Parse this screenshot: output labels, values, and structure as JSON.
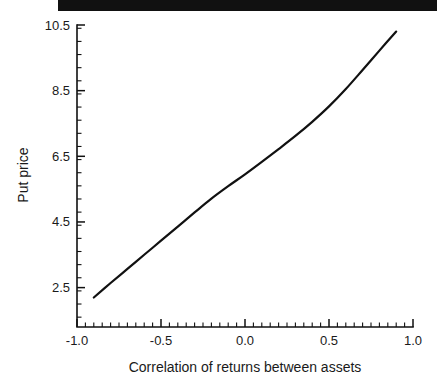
{
  "figure": {
    "header_bar_color": "#111111",
    "background_color": "#ffffff",
    "line_color": "#111111"
  },
  "chart_data": {
    "type": "line",
    "title": "",
    "subtitle": "",
    "xlabel": "Correlation of returns between assets",
    "ylabel": "Put price",
    "xlim": [
      -1.0,
      1.0
    ],
    "ylim": [
      1.3,
      10.5
    ],
    "grid": false,
    "legend": null,
    "xticks": [
      -1.0,
      -0.5,
      0.0,
      0.5,
      1.0
    ],
    "xtick_labels": [
      "-1.0",
      "-0.5",
      "0.0",
      "0.5",
      "1.0"
    ],
    "yticks": [
      2.5,
      4.5,
      6.5,
      8.5,
      10.5
    ],
    "ytick_labels": [
      "2.5",
      "4.5",
      "6.5",
      "8.5",
      "10.5"
    ],
    "x_minor_tick_step": 0.05,
    "y_minor_tick_step": 0.4,
    "series": [
      {
        "name": "Put price vs correlation",
        "x": [
          -0.9,
          -0.8,
          -0.7,
          -0.6,
          -0.5,
          -0.4,
          -0.3,
          -0.2,
          -0.1,
          0.0,
          0.1,
          0.2,
          0.3,
          0.4,
          0.5,
          0.6,
          0.7,
          0.8,
          0.9
        ],
        "values": [
          2.2,
          2.64,
          3.07,
          3.5,
          3.93,
          4.36,
          4.79,
          5.21,
          5.59,
          5.95,
          6.33,
          6.72,
          7.12,
          7.55,
          8.02,
          8.55,
          9.13,
          9.72,
          10.3
        ]
      }
    ]
  },
  "axis_labels": {
    "x_axis_title": "Correlation of returns between assets",
    "y_axis_title": "Put price"
  }
}
